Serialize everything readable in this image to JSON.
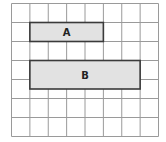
{
  "grid": {
    "columns": 8,
    "rows": 7,
    "line_color": "#9a9a9a"
  },
  "shapes": [
    {
      "label": "A",
      "col_start": 1,
      "col_span": 4,
      "row_start": 1,
      "row_span": 1,
      "fill": "#e2e2e2",
      "stroke": "#3a3a3a"
    },
    {
      "label": "B",
      "col_start": 1,
      "col_span": 6,
      "row_start": 3,
      "row_span": 1.5,
      "fill": "#e2e2e2",
      "stroke": "#3a3a3a"
    }
  ]
}
